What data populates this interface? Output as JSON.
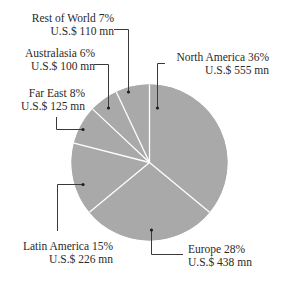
{
  "chart_data": {
    "type": "pie",
    "title": "",
    "start_angle_deg": 0,
    "direction": "clockwise",
    "slice_color": "#a9a9a9",
    "separator_color": "#ffffff",
    "leader_color": "#3a3a3a",
    "categories": [
      "North America",
      "Europe",
      "Latin America",
      "Far East",
      "Australasia",
      "Rest of World"
    ],
    "percent": [
      36,
      28,
      15,
      8,
      6,
      7
    ],
    "values_usd_mn": [
      555,
      438,
      226,
      125,
      100,
      110
    ],
    "slices": [
      {
        "name": "North America",
        "percent_label": "36%",
        "value_label": "U.S.$ 555 mn",
        "percent": 36,
        "value": 555
      },
      {
        "name": "Europe",
        "percent_label": "28%",
        "value_label": "U.S.$ 438 mn",
        "percent": 28,
        "value": 438
      },
      {
        "name": "Latin America",
        "percent_label": "15%",
        "value_label": "U.S.$ 226 mn",
        "percent": 15,
        "value": 226
      },
      {
        "name": "Far East",
        "percent_label": "8%",
        "value_label": "U.S.$ 125 mn",
        "percent": 8,
        "value": 125
      },
      {
        "name": "Australasia",
        "percent_label": "6%",
        "value_label": "U.S.$ 100 mn",
        "percent": 6,
        "value": 100
      },
      {
        "name": "Rest of World",
        "percent_label": "7%",
        "value_label": "U.S.$ 110 mn",
        "percent": 7,
        "value": 110
      }
    ]
  },
  "labels": {
    "north_america": {
      "line1": "North America  36%",
      "line2": "U.S.$ 555 mn"
    },
    "europe": {
      "line1": "Europe  28%",
      "line2": "U.S.$ 438 mn"
    },
    "latin_america": {
      "line1": "Latin America  15%",
      "line2": "U.S.$ 226 mn"
    },
    "far_east": {
      "line1": "Far East  8%",
      "line2": "U.S.$ 125 mn"
    },
    "australasia": {
      "line1": "Australasia  6%",
      "line2": "U.S.$ 100 mn"
    },
    "rest_of_world": {
      "line1": "Rest of World  7%",
      "line2": "U.S.$ 110 mn"
    }
  }
}
